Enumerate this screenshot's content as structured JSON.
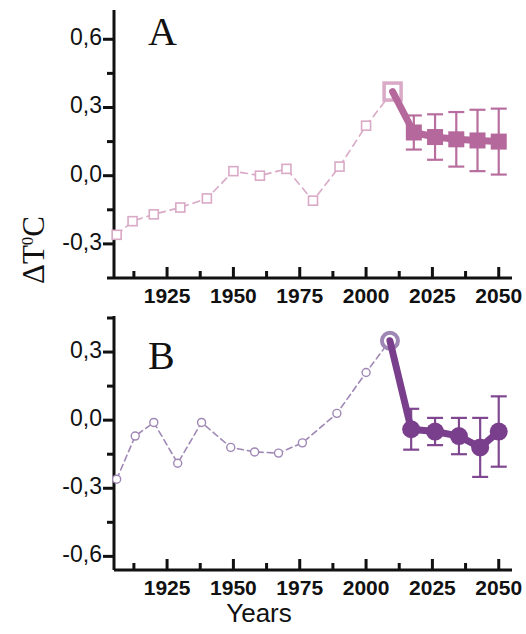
{
  "figure": {
    "ylabel": "ΔT⁰C",
    "ylabel_base": "ΔT",
    "ylabel_sup": "0",
    "ylabel_tail": "C",
    "xlabel": "Years",
    "panel_a_letter": "A",
    "panel_b_letter": "B",
    "colors": {
      "panel_a_series": "#d9a9c6",
      "panel_a_forecast": "#b5689b",
      "panel_b_series": "#9f87b5",
      "panel_b_forecast": "#7a3f8c",
      "axis": "#111111",
      "background": "#ffffff"
    }
  },
  "chart_data": [
    {
      "type": "line",
      "panel": "A",
      "title": "A",
      "xlabel": "Years",
      "ylabel": "ΔT⁰C",
      "xlim": [
        1905,
        2055
      ],
      "ylim": [
        -0.45,
        0.72
      ],
      "xticks": [
        1925,
        1950,
        1975,
        2000,
        2025,
        2050
      ],
      "xticklabels": [
        "1925",
        "1950",
        "1975",
        "2000",
        "2025",
        "2050"
      ],
      "yticks": [
        -0.3,
        0.0,
        0.3,
        0.6
      ],
      "yticklabels": [
        "-0,3",
        "0,0",
        "0,3",
        "0,6"
      ],
      "minor_xtick_step": 12.5,
      "minor_ytick_step": 0.15,
      "grid": false,
      "legend": "none",
      "series": [
        {
          "name": "observed",
          "style": "dashed-open-square",
          "marker": "open-square",
          "color": "#d9a9c6",
          "x": [
            1906,
            1912,
            1920,
            1930,
            1940,
            1950,
            1960,
            1970,
            1980,
            1990,
            2000,
            2010
          ],
          "values": [
            -0.26,
            -0.2,
            -0.17,
            -0.14,
            -0.1,
            0.02,
            0.0,
            0.03,
            -0.11,
            0.04,
            0.22,
            0.37
          ]
        },
        {
          "name": "forecast",
          "style": "solid-filled-square",
          "marker": "filled-square",
          "color": "#b5689b",
          "x": [
            2010,
            2018,
            2026,
            2034,
            2042,
            2050
          ],
          "values": [
            0.37,
            0.19,
            0.17,
            0.16,
            0.155,
            0.15
          ],
          "errors": [
            null,
            0.075,
            0.1,
            0.12,
            0.135,
            0.145
          ]
        }
      ]
    },
    {
      "type": "line",
      "panel": "B",
      "title": "B",
      "xlabel": "Years",
      "ylabel": "ΔT⁰C",
      "xlim": [
        1905,
        2055
      ],
      "ylim": [
        -0.66,
        0.45
      ],
      "xticks": [
        1925,
        1950,
        1975,
        2000,
        2025,
        2050
      ],
      "xticklabels": [
        "1925",
        "1950",
        "1975",
        "2000",
        "2025",
        "2050"
      ],
      "yticks": [
        -0.6,
        -0.3,
        0.0,
        0.3
      ],
      "yticklabels": [
        "-0,6",
        "-0,3",
        "0,0",
        "0,3"
      ],
      "minor_xtick_step": 12.5,
      "minor_ytick_step": 0.15,
      "grid": false,
      "legend": "none",
      "series": [
        {
          "name": "observed",
          "style": "dashed-open-circle",
          "marker": "open-circle",
          "color": "#9f87b5",
          "x": [
            1906,
            1913,
            1920,
            1929,
            1938,
            1949,
            1958,
            1967,
            1976,
            1989,
            2000,
            2009
          ],
          "values": [
            -0.26,
            -0.07,
            -0.01,
            -0.19,
            -0.01,
            -0.12,
            -0.14,
            -0.145,
            -0.1,
            0.03,
            0.21,
            0.35
          ]
        },
        {
          "name": "forecast",
          "style": "solid-filled-circle",
          "marker": "filled-circle",
          "color": "#7a3f8c",
          "x": [
            2009,
            2017,
            2026,
            2035,
            2043,
            2050
          ],
          "values": [
            0.35,
            -0.04,
            -0.05,
            -0.07,
            -0.12,
            -0.05
          ],
          "errors": [
            null,
            0.09,
            0.06,
            0.08,
            0.13,
            0.155
          ]
        }
      ]
    }
  ]
}
